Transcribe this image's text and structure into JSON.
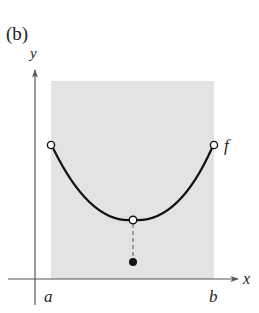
{
  "figure": {
    "panel_label": "(b)",
    "axes": {
      "x_label": "x",
      "y_label": "y"
    },
    "interval": {
      "left_label": "a",
      "right_label": "b"
    },
    "function_label": "f",
    "colors": {
      "shade": "#e3e3e3",
      "curve": "#111111",
      "axis": "#555555"
    },
    "points": [
      {
        "name": "left-endpoint",
        "type": "open"
      },
      {
        "name": "minimum-hole",
        "type": "open"
      },
      {
        "name": "isolated-value",
        "type": "filled"
      },
      {
        "name": "right-endpoint",
        "type": "open"
      }
    ]
  }
}
